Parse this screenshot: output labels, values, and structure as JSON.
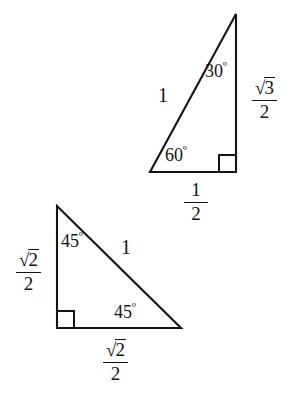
{
  "figure": {
    "background_color": "#ffffff",
    "stroke_color": "#141414",
    "text_color": "#141414"
  },
  "triangles": [
    {
      "id": "triangle-30-60-90",
      "name": "30-60-90 triangle",
      "vertices": {
        "apex": [
          236,
          14
        ],
        "bottom_left": [
          150,
          172
        ],
        "bottom_right": [
          236,
          172
        ]
      },
      "right_angle_marker": {
        "corner": [
          236,
          172
        ],
        "size": 17
      },
      "labels": {
        "hypotenuse": "1",
        "top_angle": "30",
        "bottom_left_angle": "60",
        "degree_symbol": "º",
        "vertical_side_numerator": "3",
        "vertical_side_denominator": "2",
        "base_numerator": "1",
        "base_denominator": "2",
        "radical_sign": "√"
      }
    },
    {
      "id": "triangle-45-45-90",
      "name": "45-45-90 triangle",
      "vertices": {
        "apex": [
          57,
          206
        ],
        "bottom_left": [
          57,
          328
        ],
        "bottom_right": [
          181,
          328
        ]
      },
      "right_angle_marker": {
        "corner": [
          57,
          328
        ],
        "size": 17
      },
      "labels": {
        "hypotenuse": "1",
        "top_angle": "45",
        "bottom_right_angle": "45",
        "degree_symbol": "º",
        "vertical_side_numerator": "2",
        "vertical_side_denominator": "2",
        "base_numerator": "2",
        "base_denominator": "2",
        "radical_sign": "√"
      }
    }
  ]
}
